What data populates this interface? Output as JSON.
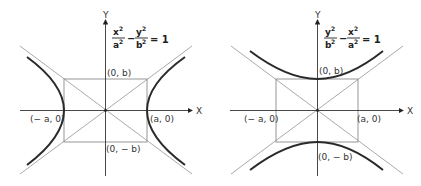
{
  "figures": [
    {
      "id": "horizontal-hyperbola",
      "equation": {
        "t1_num": "x",
        "t1_den": "a",
        "t2_num": "y",
        "t2_den": "b",
        "sup": "2",
        "minus": "−",
        "rhs": "= 1"
      },
      "axes": {
        "x": "X",
        "y": "Y"
      },
      "points": {
        "vertex_right": "(a, 0)",
        "vertex_left": "(− a, 0)",
        "covertex_top": "(0, b)",
        "covertex_bottom": "(0, − b)"
      }
    },
    {
      "id": "vertical-hyperbola",
      "equation": {
        "t1_num": "y",
        "t1_den": "b",
        "t2_num": "x",
        "t2_den": "a",
        "sup": "2",
        "minus": "−",
        "rhs": "= 1"
      },
      "axes": {
        "x": "X",
        "y": "Y"
      },
      "points": {
        "vertex_right": "(a, 0)",
        "vertex_left": "(− a, 0)",
        "covertex_top": "(0, b)",
        "covertex_bottom": "(0, − b)"
      }
    }
  ],
  "colors": {
    "curve": "#2a2a2a",
    "guide": "#9a9a9a",
    "axis": "#333333"
  }
}
